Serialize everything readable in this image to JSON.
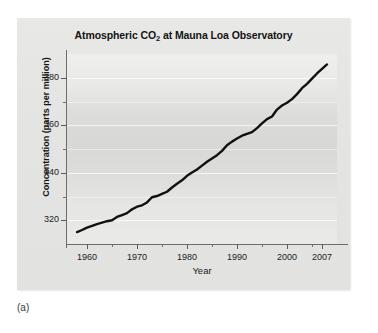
{
  "caption": "(a)",
  "chart_data": {
    "type": "line",
    "title": "Atmospheric CO2 at Mauna Loa Observatory",
    "title_prefix": "Atmospheric CO",
    "title_subscript": "2",
    "title_suffix": " at Mauna Loa Observatory",
    "xlabel": "Year",
    "ylabel": "Concentration (parts per million)",
    "xlim": [
      1956,
      2010
    ],
    "ylim": [
      310,
      390
    ],
    "grid": true,
    "legend": "none",
    "line_color": "#111111",
    "background_color": "#e5e5e3",
    "gridline_color": "#ffffff",
    "x_ticks": [
      1960,
      1970,
      1980,
      1990,
      2000,
      2007
    ],
    "x_tick_labels": [
      "1960",
      "1970",
      "1980",
      "1990",
      "2000",
      "2007"
    ],
    "x_minor_ticks": [
      1965,
      1975,
      1985,
      1995,
      2005
    ],
    "y_ticks": [
      320,
      340,
      360,
      380
    ],
    "y_tick_labels": [
      "320",
      "340",
      "360",
      "380"
    ],
    "y_minor_ticks": [
      330,
      350,
      370
    ],
    "series": [
      {
        "name": "Atmospheric CO2 concentration",
        "x": [
          1958,
          1959,
          1960,
          1961,
          1962,
          1963,
          1964,
          1965,
          1966,
          1967,
          1968,
          1969,
          1970,
          1971,
          1972,
          1973,
          1974,
          1975,
          1976,
          1977,
          1978,
          1979,
          1980,
          1981,
          1982,
          1983,
          1984,
          1985,
          1986,
          1987,
          1988,
          1989,
          1990,
          1991,
          1992,
          1993,
          1994,
          1995,
          1996,
          1997,
          1998,
          1999,
          2000,
          2001,
          2002,
          2003,
          2004,
          2005,
          2006,
          2007,
          2008
        ],
        "values": [
          315.0,
          315.9,
          316.9,
          317.6,
          318.4,
          319.0,
          319.6,
          320.0,
          321.4,
          322.2,
          323.0,
          324.6,
          325.7,
          326.3,
          327.5,
          329.7,
          330.2,
          331.1,
          332.0,
          333.8,
          335.4,
          336.8,
          338.7,
          340.1,
          341.4,
          343.0,
          344.6,
          346.0,
          347.4,
          349.2,
          351.6,
          353.1,
          354.4,
          355.6,
          356.4,
          357.1,
          358.8,
          360.8,
          362.6,
          363.7,
          366.6,
          368.3,
          369.5,
          371.0,
          373.1,
          375.6,
          377.4,
          379.6,
          381.8,
          383.7,
          385.6
        ]
      }
    ]
  }
}
